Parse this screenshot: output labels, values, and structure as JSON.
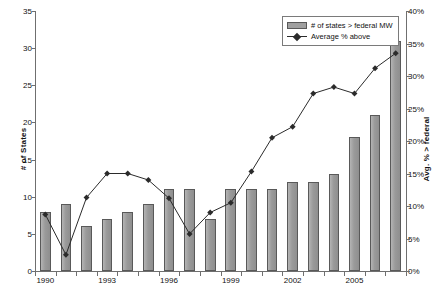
{
  "chart_data": {
    "type": "bar",
    "title": "",
    "xlabel": "",
    "ylabel": "# of States",
    "y2label": "Avg. % > federal",
    "ylim": [
      0,
      35
    ],
    "y2lim": [
      0,
      40
    ],
    "grid": false,
    "legend_position": "top-right",
    "categories": [
      "1990",
      "1991",
      "1992",
      "1993",
      "1994",
      "1995",
      "1996",
      "1997",
      "1998",
      "1999",
      "2000",
      "2001",
      "2002",
      "2003",
      "2004",
      "2005",
      "2006",
      "2007"
    ],
    "x_tick_labels": [
      "1990",
      "1993",
      "1996",
      "1999",
      "2002",
      "2005"
    ],
    "y_tick_labels": [
      "0",
      "5",
      "10",
      "15",
      "20",
      "25",
      "30",
      "35"
    ],
    "y_ticks": [
      0,
      5,
      10,
      15,
      20,
      25,
      30,
      35
    ],
    "y2_tick_labels": [
      "0%",
      "5%",
      "10%",
      "15%",
      "20%",
      "25%",
      "30%",
      "35%",
      "40%"
    ],
    "y2_ticks": [
      0,
      5,
      10,
      15,
      20,
      25,
      30,
      35,
      40
    ],
    "series": [
      {
        "name": "# of states > federal MW",
        "type": "bar",
        "axis": "left",
        "color": "#a0a0a0",
        "values": [
          8,
          9,
          6,
          7,
          8,
          9,
          11,
          11,
          7,
          11,
          11,
          11,
          12,
          12,
          13,
          18,
          21,
          31
        ]
      },
      {
        "name": "Average % above",
        "type": "line",
        "axis": "right",
        "color": "#2b2b2b",
        "values": [
          8.7,
          2.5,
          11.3,
          15.0,
          15.0,
          14.0,
          11.2,
          5.7,
          9.0,
          10.5,
          15.3,
          20.5,
          22.2,
          27.3,
          28.3,
          27.3,
          31.2,
          33.5
        ]
      }
    ]
  },
  "legend": {
    "items": [
      {
        "label": "# of states > federal MW",
        "marker": "bar-swatch"
      },
      {
        "label": "Average % above",
        "marker": "line-marker-swatch"
      }
    ]
  },
  "axes": {
    "left_title": "# of States",
    "right_title": "Avg. % > federal"
  }
}
